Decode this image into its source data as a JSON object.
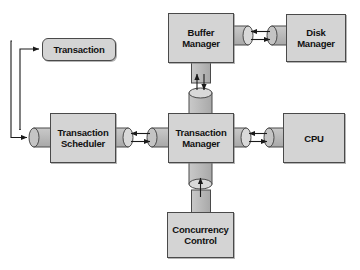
{
  "diagram": {
    "type": "block-diagram",
    "colors": {
      "box_fill": "#d4d4d4",
      "box_stroke": "#4a4a4a",
      "cylinder_fill": "#c0c0c0",
      "cylinder_cap": "#d9d9d9",
      "connector_line": "#1a1a1a",
      "background": "#ffffff",
      "text": "#111111"
    },
    "nodes": [
      {
        "id": "buffer_manager",
        "label": "Buffer\nManager",
        "line1": "Buffer",
        "line2": "Manager",
        "shape": "rect",
        "x": 168,
        "y": 13,
        "w": 66,
        "h": 50
      },
      {
        "id": "disk_manager",
        "label": "Disk\nManager",
        "line1": "Disk",
        "line2": "Manager",
        "shape": "rect",
        "x": 286,
        "y": 14,
        "w": 60,
        "h": 48
      },
      {
        "id": "transaction",
        "label": "Transaction",
        "line1": "Transaction",
        "line2": "",
        "shape": "rounded",
        "x": 42,
        "y": 38,
        "w": 74,
        "h": 23
      },
      {
        "id": "transaction_scheduler",
        "label": "Transaction\nScheduler",
        "line1": "Transaction",
        "line2": "Scheduler",
        "shape": "rect",
        "x": 50,
        "y": 113,
        "w": 66,
        "h": 50
      },
      {
        "id": "transaction_manager",
        "label": "Transaction\nManager",
        "line1": "Transaction",
        "line2": "Manager",
        "shape": "rect",
        "x": 168,
        "y": 113,
        "w": 66,
        "h": 50
      },
      {
        "id": "cpu",
        "label": "CPU",
        "line1": "CPU",
        "line2": "",
        "shape": "rect",
        "x": 283,
        "y": 113,
        "w": 62,
        "h": 50
      },
      {
        "id": "concurrency_control",
        "label": "Concurrency\nControl",
        "line1": "Concurrency",
        "line2": "Control",
        "shape": "rect",
        "x": 167,
        "y": 212,
        "w": 67,
        "h": 46
      }
    ],
    "connections": [
      {
        "from": "buffer_manager",
        "to": "disk_manager",
        "style": "cylinder-pipe",
        "orientation": "horizontal",
        "arrows": "bidirectional"
      },
      {
        "from": "buffer_manager",
        "to": "transaction_manager",
        "style": "cylinder-pipe",
        "orientation": "vertical",
        "arrows": "bidirectional"
      },
      {
        "from": "transaction_scheduler",
        "to": "transaction_manager",
        "style": "cylinder-pipe",
        "orientation": "horizontal",
        "arrows": "bidirectional"
      },
      {
        "from": "transaction_manager",
        "to": "cpu",
        "style": "cylinder-pipe",
        "orientation": "horizontal",
        "arrows": "bidirectional"
      },
      {
        "from": "concurrency_control",
        "to": "transaction_manager",
        "style": "cylinder-pipe",
        "orientation": "vertical",
        "arrows": "bidirectional"
      },
      {
        "from": "transaction_scheduler",
        "to": "transaction",
        "style": "routed-line",
        "orientation": "left-loop",
        "arrows": "single"
      },
      {
        "from": "transaction",
        "to": "transaction_scheduler",
        "style": "routed-line",
        "orientation": "left-loop",
        "arrows": "single"
      }
    ]
  }
}
